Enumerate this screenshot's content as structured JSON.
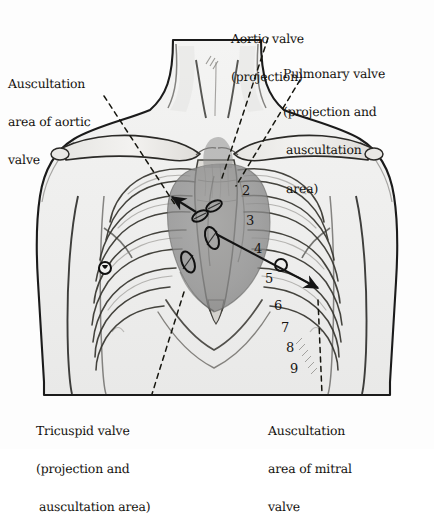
{
  "figure": {
    "background_color": "#fdfdfd",
    "ink_color": "#1a1a1a",
    "heart_shade_color": "#8a8a8a",
    "skin_shade_color": "#efefee"
  },
  "labels": {
    "aortic_auscultation": {
      "lines": [
        "Auscultation",
        "area of aortic",
        "valve"
      ]
    },
    "aortic_projection": {
      "lines": [
        "Aortic valve",
        "(projection)"
      ]
    },
    "pulmonary_valve": {
      "lines": [
        "Pulmonary valve",
        "(projection and",
        "auscultation",
        "area)"
      ]
    },
    "tricuspid_valve": {
      "lines": [
        "Tricuspid valve",
        "(projection and",
        "auscultation area)"
      ]
    },
    "mitral_auscultation": {
      "lines": [
        "Auscultation",
        "area of mitral",
        "valve"
      ]
    }
  },
  "rib_numbers": [
    {
      "label": "2",
      "x": 242,
      "y": 183
    },
    {
      "label": "3",
      "x": 246,
      "y": 213
    },
    {
      "label": "4",
      "x": 254,
      "y": 241
    },
    {
      "label": "5",
      "x": 265,
      "y": 271
    },
    {
      "label": "6",
      "x": 274,
      "y": 298
    },
    {
      "label": "7",
      "x": 281,
      "y": 320
    },
    {
      "label": "8",
      "x": 286,
      "y": 340
    },
    {
      "label": "9",
      "x": 290,
      "y": 361
    }
  ],
  "markers": {
    "valve_projection_ellipses": [
      {
        "name": "pulmonary-valve-ellipse",
        "cx": 214,
        "cy": 206,
        "rx": 8.5,
        "ry": 4.6,
        "rot": -28
      },
      {
        "name": "aortic-valve-ellipse",
        "cx": 200,
        "cy": 215,
        "rx": 8.5,
        "ry": 4.6,
        "rot": -28
      },
      {
        "name": "mitral-valve-ellipse",
        "cx": 212,
        "cy": 238,
        "rx": 6.2,
        "ry": 11.5,
        "rot": -20
      },
      {
        "name": "tricuspid-valve-ellipse",
        "cx": 188,
        "cy": 262,
        "rx": 6.0,
        "ry": 11.0,
        "rot": -22
      }
    ],
    "auscultation_points": [
      {
        "name": "aortic-auscultation-point",
        "cx": 105,
        "cy": 268,
        "r": 6.0
      },
      {
        "name": "pulmonary-auscultation-point",
        "cx": 281,
        "cy": 265,
        "r": 6.0
      }
    ]
  }
}
